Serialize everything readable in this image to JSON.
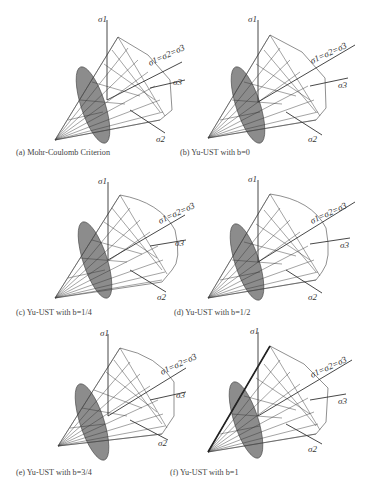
{
  "figure": {
    "panels": [
      {
        "id": "a",
        "caption": "(a) Mohr-Coulomb Criterion",
        "criterion": "Mohr-Coulomb",
        "b": null,
        "base_shape": "hexagon"
      },
      {
        "id": "b",
        "caption": "(b) Yu-UST with b=0",
        "criterion": "Yu-UST",
        "b": "0",
        "base_shape": "hexagon"
      },
      {
        "id": "c",
        "caption": "(c) Yu-UST with b=1/4",
        "criterion": "Yu-UST",
        "b": "1/4",
        "base_shape": "rounded-hexagon"
      },
      {
        "id": "d",
        "caption": "(d) Yu-UST with b=1/2",
        "criterion": "Yu-UST",
        "b": "1/2",
        "base_shape": "rounded-hexagon"
      },
      {
        "id": "e",
        "caption": "(e) Yu-UST with b=3/4",
        "criterion": "Yu-UST",
        "b": "3/4",
        "base_shape": "rounded-hexagon"
      },
      {
        "id": "f",
        "caption": "(f) Yu-UST with b=1",
        "criterion": "Yu-UST",
        "b": "1",
        "base_shape": "hexagon"
      }
    ],
    "axis_labels": {
      "sigma1": "σ1",
      "sigma2": "σ2",
      "sigma3": "σ3",
      "hydrostatic": "σ1=σ2=σ3"
    },
    "colors": {
      "line": "#333333",
      "ellipse_fill": "#8c8c8c",
      "background": "#ffffff"
    }
  }
}
